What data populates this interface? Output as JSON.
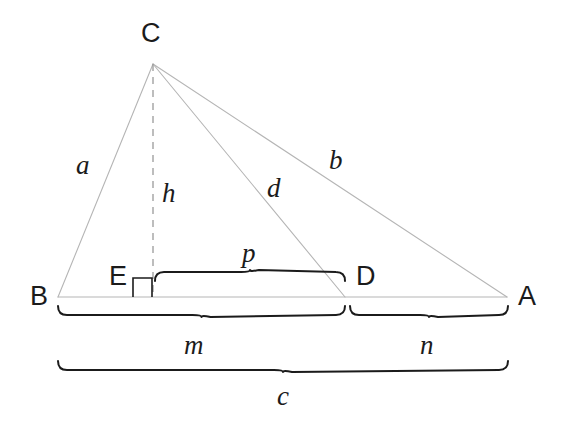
{
  "figure": {
    "background_color": "#ffffff",
    "line_color": "#b5b5b5",
    "dash_color": "#9a9a9a",
    "brace_color": "#1b1b1b",
    "text_color": "#1b1b1b"
  },
  "vertices": [
    {
      "id": "A",
      "label": "A",
      "x": 507,
      "y": 297,
      "label_x": 518,
      "label_y": 283
    },
    {
      "id": "B",
      "label": "B",
      "x": 58,
      "y": 297,
      "label_x": 30,
      "label_y": 283
    },
    {
      "id": "C",
      "label": "C",
      "x": 153,
      "y": 64,
      "label_x": 141,
      "label_y": 20
    },
    {
      "id": "D",
      "label": "D",
      "x": 345,
      "y": 297,
      "label_x": 356,
      "label_y": 263
    },
    {
      "id": "E",
      "label": "E",
      "x": 153,
      "y": 297,
      "label_x": 109,
      "label_y": 263
    }
  ],
  "segments": [
    {
      "id": "a",
      "label": "a",
      "from": "B",
      "to": "C",
      "label_x": 76,
      "label_y": 152,
      "style": "solid"
    },
    {
      "id": "b",
      "label": "b",
      "from": "C",
      "to": "A",
      "label_x": 329,
      "label_y": 147,
      "style": "solid"
    },
    {
      "id": "d",
      "label": "d",
      "from": "C",
      "to": "D",
      "label_x": 267,
      "label_y": 175,
      "style": "solid"
    },
    {
      "id": "h",
      "label": "h",
      "from": "C",
      "to": "E",
      "label_x": 162,
      "label_y": 180,
      "style": "dashed"
    },
    {
      "id": "base",
      "label": "",
      "from": "B",
      "to": "A",
      "label_x": 0,
      "label_y": 0,
      "style": "solid"
    }
  ],
  "braces": [
    {
      "id": "p",
      "label": "p",
      "from_x": 155,
      "to_x": 345,
      "y": 281,
      "direction": "up",
      "label_x": 242,
      "label_y": 240
    },
    {
      "id": "m",
      "label": "m",
      "from_x": 58,
      "to_x": 345,
      "y": 306,
      "direction": "down",
      "label_x": 184,
      "label_y": 332
    },
    {
      "id": "n",
      "label": "n",
      "from_x": 350,
      "to_x": 508,
      "y": 306,
      "direction": "down",
      "label_x": 420,
      "label_y": 332
    },
    {
      "id": "c",
      "label": "c",
      "from_x": 58,
      "to_x": 508,
      "y": 361,
      "direction": "down",
      "label_x": 277,
      "label_y": 383
    }
  ],
  "right_angle": {
    "name": "right-angle-marker-at-E",
    "x": 133,
    "y": 278,
    "size": 19
  }
}
